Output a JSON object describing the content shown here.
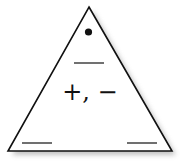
{
  "diagram": {
    "type": "fact-family-triangle",
    "operations": "+, −",
    "top_marker": "dot",
    "blanks": [
      "top",
      "bottom-left",
      "bottom-right"
    ],
    "colors": {
      "stroke": "#111111",
      "fill": "#ffffff",
      "shadow": "#bdbdbd"
    }
  }
}
